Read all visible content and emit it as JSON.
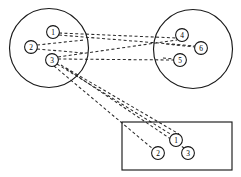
{
  "diagram": {
    "title": "Three-cluster node diagram with dashed inter-cluster links",
    "background_color": "#ffffff",
    "stroke_color": "#1a1a1a",
    "edge_color": "#2b2b2b",
    "node_fill": "#ffffff",
    "edge_style": "dashed",
    "clusters": [
      {
        "id": "left-circle",
        "shape": "circle",
        "name": "left-cluster",
        "cx": 49,
        "cy": 48,
        "r": 39.5,
        "nodes": [
          {
            "id": "L1",
            "label": "1",
            "cx": 53,
            "cy": 32,
            "r": 6.4
          },
          {
            "id": "L2",
            "label": "2",
            "cx": 31,
            "cy": 47,
            "r": 6.4
          },
          {
            "id": "L3",
            "label": "3",
            "cx": 52,
            "cy": 60,
            "r": 6.4
          }
        ]
      },
      {
        "id": "right-circle",
        "shape": "circle",
        "name": "right-cluster",
        "cx": 193,
        "cy": 49,
        "r": 39.5,
        "nodes": [
          {
            "id": "R4",
            "label": "4",
            "cx": 182,
            "cy": 35,
            "r": 6.4
          },
          {
            "id": "R5",
            "label": "5",
            "cx": 180,
            "cy": 60,
            "r": 6.4
          },
          {
            "id": "R6",
            "label": "6",
            "cx": 201,
            "cy": 48,
            "r": 6.4
          }
        ]
      },
      {
        "id": "bottom-rectangle",
        "shape": "rectangle",
        "name": "bottom-cluster",
        "x": 122,
        "y": 122,
        "width": 110,
        "height": 48,
        "nodes": [
          {
            "id": "B1",
            "label": "1",
            "cx": 176,
            "cy": 140,
            "r": 6.4
          },
          {
            "id": "B2",
            "label": "2",
            "cx": 158,
            "cy": 153,
            "r": 6.4
          },
          {
            "id": "B3",
            "label": "3",
            "cx": 188,
            "cy": 153,
            "r": 6.4
          }
        ]
      }
    ],
    "intra_edges": [
      {
        "id": "e-L2-L1",
        "from": "L2",
        "to": "L1",
        "x1": 37,
        "y1": 45,
        "x2": 84,
        "y2": 40
      },
      {
        "id": "e-L2-L3",
        "from": "L2",
        "to": "L3",
        "x1": 37,
        "y1": 48,
        "x2": 84,
        "y2": 52
      },
      {
        "id": "e-R4-R6",
        "from": "R4",
        "to": "R6",
        "x1": 182,
        "y1": 41,
        "x2": 195,
        "y2": 47
      },
      {
        "id": "e-R5-R6",
        "from": "R5",
        "to": "R6",
        "x1": 186,
        "y1": 58,
        "x2": 195,
        "y2": 50
      }
    ],
    "inter_edges": [
      {
        "id": "e-L1-R4",
        "from": "L1",
        "to": "R4",
        "x1": 59,
        "y1": 33,
        "x2": 177,
        "y2": 38
      },
      {
        "id": "e-L1-R6",
        "from": "L1",
        "to": "R6",
        "x1": 59,
        "y1": 35,
        "x2": 195,
        "y2": 47
      },
      {
        "id": "e-L3-R5",
        "from": "L3",
        "to": "R5",
        "x1": 58,
        "y1": 59,
        "x2": 174,
        "y2": 60
      },
      {
        "id": "e-L3-R4",
        "from": "L3",
        "to": "R4",
        "x1": 58,
        "y1": 57,
        "x2": 177,
        "y2": 40
      },
      {
        "id": "e-L3-B1",
        "from": "L3",
        "to": "B1",
        "x1": 57,
        "y1": 64,
        "x2": 172,
        "y2": 136
      },
      {
        "id": "e-L3-B2",
        "from": "L3",
        "to": "B2",
        "x1": 54,
        "y1": 66,
        "x2": 153,
        "y2": 149
      },
      {
        "id": "e-L3-B3",
        "from": "L3",
        "to": "B3",
        "x1": 60,
        "y1": 64,
        "x2": 184,
        "y2": 149
      },
      {
        "id": "e-Lc-B1",
        "from": "left-cluster",
        "to": "B1",
        "x1": 64,
        "y1": 66,
        "x2": 178,
        "y2": 135
      }
    ]
  }
}
